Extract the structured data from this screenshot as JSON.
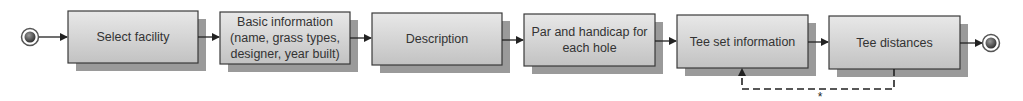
{
  "diagram": {
    "type": "process-flow",
    "start_node": {
      "icon": "start-event-circle"
    },
    "end_node": {
      "icon": "end-event-circle"
    },
    "steps": [
      {
        "id": "select-facility",
        "lines": [
          "Select facility"
        ]
      },
      {
        "id": "basic-information",
        "lines": [
          "Basic information",
          "(name, grass types,",
          "designer, year built)"
        ]
      },
      {
        "id": "description",
        "lines": [
          "Description"
        ]
      },
      {
        "id": "par-handicap",
        "lines": [
          "Par and handicap for",
          "each hole"
        ]
      },
      {
        "id": "tee-set-information",
        "lines": [
          "Tee set information"
        ]
      },
      {
        "id": "tee-distances",
        "lines": [
          "Tee distances"
        ]
      }
    ],
    "loop": {
      "from": "tee-distances",
      "to": "tee-set-information",
      "style": "dashed",
      "label": "*"
    },
    "colors": {
      "box_fill_top": "#e6e6e6",
      "box_fill_bottom": "#c4c4c4",
      "box_border": "#3a3a3a",
      "shadow": "#9a9a9a",
      "text": "#333333",
      "connector": "#222222"
    }
  }
}
